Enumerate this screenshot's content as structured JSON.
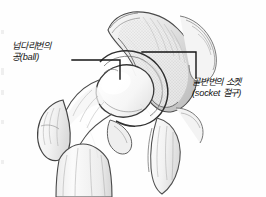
{
  "figure": {
    "background_color": "#fefefe",
    "ink_color": "#141414",
    "sketch_color": "#6e6e6e"
  },
  "labels": {
    "ball": {
      "line1": "넙다리번의",
      "line2": "공(ball)"
    },
    "socket": {
      "line1": "골반번의 소켓",
      "line2": "(socket 절구)"
    }
  },
  "leaders": {
    "ball_leader": {
      "points": "72,60 120,60 120,79",
      "color": "#141414"
    },
    "socket_leader": {
      "points": "142,52 196,52 196,78",
      "color": "#141414"
    }
  },
  "anatomy_parts": [
    "ilium",
    "acetabulum",
    "femoral-head",
    "femoral-neck",
    "greater-trochanter",
    "lesser-trochanter",
    "femoral-shaft",
    "ischium",
    "pubis"
  ]
}
